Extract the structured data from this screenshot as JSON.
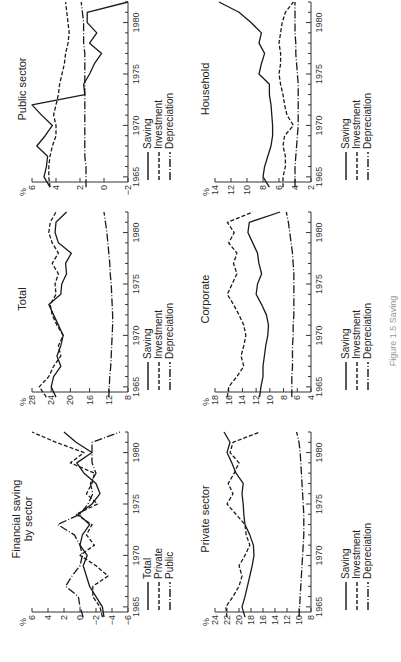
{
  "caption": "Figure 1.5 Saving",
  "legend_labels": {
    "saving": "Saving",
    "investment": "Investment",
    "depreciation": "Depreciation",
    "total": "Total",
    "private": "Private",
    "public": "Public"
  },
  "panels": [
    {
      "id": "financial",
      "title": "Financial saving\nby sector",
      "unit": "%"
    },
    {
      "id": "total",
      "title": "Total",
      "unit": "%"
    },
    {
      "id": "public",
      "title": "Public sector",
      "unit": "%"
    },
    {
      "id": "private",
      "title": "Private sector",
      "unit": "%"
    },
    {
      "id": "corporate",
      "title": "Corporate",
      "unit": "%"
    },
    {
      "id": "household",
      "title": "Household",
      "unit": "%"
    }
  ],
  "chart_data": [
    {
      "type": "line",
      "title": "Financial saving by sector",
      "ylabel": "%",
      "xlabel": "",
      "x": [
        1964,
        1965,
        1966,
        1967,
        1968,
        1969,
        1970,
        1971,
        1972,
        1973,
        1974,
        1975,
        1976,
        1977,
        1978,
        1979,
        1980,
        1981,
        1982
      ],
      "xticks": [
        1965,
        1970,
        1975,
        1980
      ],
      "yticks": [
        -6,
        -4,
        -2,
        0,
        2,
        4,
        6
      ],
      "ylim": [
        -6,
        6
      ],
      "series": [
        {
          "name": "Total",
          "style": "solid",
          "values": [
            -3.0,
            -2.8,
            -2.0,
            -1.2,
            -0.8,
            -0.4,
            -0.9,
            0.0,
            -0.3,
            -1.2,
            0.2,
            -1.5,
            -2.5,
            -2.0,
            -0.5,
            0.4,
            -1.5,
            0.5,
            2.0
          ]
        },
        {
          "name": "Private",
          "style": "dashed",
          "values": [
            -2.8,
            -2.5,
            -1.6,
            -1.6,
            -3.5,
            -2.0,
            0.0,
            -1.8,
            -0.8,
            -1.5,
            0.5,
            -2.2,
            -0.8,
            -1.5,
            -1.8,
            1.2,
            -0.5,
            3.0,
            6.0
          ]
        },
        {
          "name": "Public",
          "style": "dashdot",
          "values": [
            -0.4,
            0.0,
            0.2,
            1.8,
            1.0,
            0.0,
            -0.3,
            0.0,
            0.7,
            2.8,
            0.0,
            -1.0,
            -1.6,
            -1.3,
            -2.0,
            -1.5,
            -1.5,
            -1.5,
            -5.0
          ]
        }
      ]
    },
    {
      "type": "line",
      "title": "Total",
      "ylabel": "%",
      "xlabel": "",
      "x": [
        1964,
        1965,
        1966,
        1967,
        1968,
        1969,
        1970,
        1971,
        1972,
        1973,
        1974,
        1975,
        1976,
        1977,
        1978,
        1979,
        1980,
        1981,
        1982
      ],
      "xticks": [
        1965,
        1970,
        1975,
        1980
      ],
      "yticks": [
        8,
        12,
        16,
        20,
        24,
        28
      ],
      "ylim": [
        8,
        28
      ],
      "series": [
        {
          "name": "Saving",
          "style": "solid",
          "values": [
            23.0,
            24.0,
            23.5,
            22.0,
            22.8,
            22.0,
            21.5,
            22.5,
            23.5,
            24.5,
            22.0,
            21.8,
            20.8,
            21.0,
            19.8,
            22.5,
            23.2,
            23.0,
            20.8
          ]
        },
        {
          "name": "Investment",
          "style": "dashed",
          "values": [
            25.0,
            26.5,
            24.5,
            23.5,
            22.0,
            22.5,
            21.5,
            22.8,
            23.8,
            24.2,
            23.0,
            23.2,
            22.5,
            23.8,
            22.5,
            23.8,
            24.5,
            24.2,
            23.0
          ]
        },
        {
          "name": "Depreciation",
          "style": "dashdot",
          "values": [
            12.0,
            11.9,
            11.8,
            11.6,
            11.5,
            11.4,
            11.3,
            11.2,
            11.2,
            11.3,
            11.4,
            11.5,
            11.7,
            11.8,
            12.0,
            12.2,
            12.4,
            12.7,
            13.0
          ]
        }
      ]
    },
    {
      "type": "line",
      "title": "Public sector",
      "ylabel": "%",
      "xlabel": "",
      "x": [
        1964,
        1965,
        1966,
        1967,
        1968,
        1969,
        1970,
        1971,
        1972,
        1973,
        1974,
        1975,
        1976,
        1977,
        1978,
        1979,
        1980,
        1981,
        1982
      ],
      "xticks": [
        1965,
        1970,
        1975,
        1980
      ],
      "yticks": [
        -2,
        0,
        2,
        4,
        6
      ],
      "ylim": [
        -2,
        6
      ],
      "series": [
        {
          "name": "Saving",
          "style": "solid",
          "values": [
            4.5,
            5.0,
            4.8,
            4.7,
            5.6,
            4.9,
            4.3,
            5.2,
            6.0,
            1.6,
            1.7,
            1.2,
            0.8,
            0.2,
            1.2,
            0.6,
            1.4,
            1.4,
            -2.0
          ]
        },
        {
          "name": "Investment",
          "style": "dashed",
          "values": [
            4.5,
            4.6,
            4.6,
            4.5,
            4.3,
            4.0,
            4.0,
            4.2,
            4.0,
            3.8,
            3.7,
            3.5,
            3.3,
            3.2,
            3.0,
            2.9,
            3.0,
            3.1,
            3.2
          ]
        },
        {
          "name": "Depreciation",
          "style": "dashdot",
          "values": [
            1.5,
            1.5,
            1.5,
            1.6,
            1.6,
            1.6,
            1.6,
            1.6,
            1.6,
            1.6,
            1.6,
            1.6,
            1.6,
            1.6,
            1.7,
            1.7,
            1.7,
            1.8,
            1.9
          ]
        }
      ]
    },
    {
      "type": "line",
      "title": "Private sector",
      "ylabel": "%",
      "xlabel": "",
      "x": [
        1964,
        1965,
        1966,
        1967,
        1968,
        1969,
        1970,
        1971,
        1972,
        1973,
        1974,
        1975,
        1976,
        1977,
        1978,
        1979,
        1980,
        1981,
        1982
      ],
      "xticks": [
        1965,
        1970,
        1975,
        1980
      ],
      "yticks": [
        8,
        10,
        12,
        14,
        16,
        18,
        20,
        22,
        24
      ],
      "ylim": [
        8,
        24
      ],
      "series": [
        {
          "name": "Saving",
          "style": "solid",
          "values": [
            19.0,
            19.5,
            19.0,
            18.6,
            18.2,
            17.8,
            17.5,
            17.6,
            18.2,
            19.0,
            19.2,
            19.3,
            19.5,
            19.3,
            20.5,
            21.2,
            22.0,
            21.5,
            22.5
          ]
        },
        {
          "name": "Investment",
          "style": "dashed",
          "values": [
            22.0,
            22.2,
            21.0,
            20.0,
            19.5,
            20.0,
            19.0,
            18.2,
            18.8,
            19.0,
            20.5,
            22.0,
            21.0,
            21.8,
            20.8,
            20.0,
            21.5,
            21.0,
            16.5
          ]
        },
        {
          "name": "Depreciation",
          "style": "dashdot",
          "values": [
            10.0,
            9.9,
            9.8,
            9.7,
            9.6,
            9.5,
            9.4,
            9.3,
            9.2,
            9.2,
            9.2,
            9.3,
            9.4,
            9.5,
            9.6,
            9.7,
            9.8,
            10.0,
            10.4
          ]
        }
      ]
    },
    {
      "type": "line",
      "title": "Corporate",
      "ylabel": "%",
      "xlabel": "",
      "x": [
        1964,
        1965,
        1966,
        1967,
        1968,
        1969,
        1970,
        1971,
        1972,
        1973,
        1974,
        1975,
        1976,
        1977,
        1978,
        1979,
        1980,
        1981,
        1982
      ],
      "xticks": [
        1965,
        1970,
        1975,
        1980
      ],
      "yticks": [
        4,
        6,
        8,
        10,
        12,
        14,
        16,
        18
      ],
      "ylim": [
        4,
        18
      ],
      "series": [
        {
          "name": "Saving",
          "style": "solid",
          "values": [
            11.5,
            11.3,
            11.0,
            11.0,
            10.8,
            10.6,
            10.3,
            10.2,
            10.5,
            11.2,
            12.0,
            11.8,
            11.2,
            11.6,
            11.8,
            12.5,
            13.2,
            13.0,
            8.5
          ]
        },
        {
          "name": "Investment",
          "style": "dashed",
          "values": [
            16.2,
            16.0,
            14.8,
            13.8,
            14.2,
            13.8,
            13.5,
            13.8,
            14.5,
            15.3,
            16.2,
            15.5,
            14.8,
            15.3,
            14.8,
            16.0,
            15.2,
            16.2,
            12.5
          ]
        },
        {
          "name": "Depreciation",
          "style": "dashdot",
          "values": [
            6.8,
            6.8,
            6.8,
            6.7,
            6.7,
            6.7,
            6.6,
            6.6,
            6.5,
            6.5,
            6.5,
            6.5,
            6.5,
            6.6,
            6.7,
            6.9,
            7.1,
            7.3,
            7.6
          ]
        }
      ]
    },
    {
      "type": "line",
      "title": "Household",
      "ylabel": "%",
      "xlabel": "",
      "x": [
        1964,
        1965,
        1966,
        1967,
        1968,
        1969,
        1970,
        1971,
        1972,
        1973,
        1974,
        1975,
        1976,
        1977,
        1978,
        1979,
        1980,
        1981,
        1982
      ],
      "xticks": [
        1965,
        1970,
        1975,
        1980
      ],
      "yticks": [
        2,
        4,
        6,
        8,
        10,
        12,
        14
      ],
      "ylim": [
        2,
        14
      ],
      "series": [
        {
          "name": "Saving",
          "style": "solid",
          "values": [
            7.2,
            8.0,
            7.8,
            7.4,
            7.0,
            6.8,
            6.8,
            6.9,
            7.0,
            7.2,
            7.2,
            8.5,
            8.2,
            7.8,
            8.5,
            8.2,
            9.5,
            11.0,
            13.5
          ]
        },
        {
          "name": "Investment",
          "style": "dashed",
          "values": [
            5.5,
            5.5,
            5.2,
            5.2,
            5.5,
            5.3,
            4.2,
            5.0,
            5.3,
            5.5,
            5.8,
            6.0,
            5.8,
            5.8,
            6.0,
            5.8,
            5.6,
            5.2,
            4.2
          ]
        },
        {
          "name": "Depreciation",
          "style": "dashdot",
          "values": [
            4.0,
            4.0,
            4.0,
            3.9,
            3.8,
            3.7,
            3.6,
            3.6,
            3.6,
            3.6,
            3.6,
            3.7,
            3.8,
            3.9,
            3.9,
            4.0,
            4.0,
            4.0,
            4.0
          ]
        }
      ]
    }
  ]
}
